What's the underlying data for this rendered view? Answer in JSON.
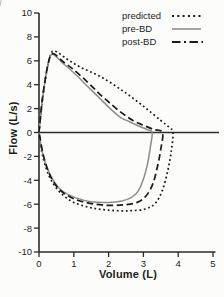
{
  "figure": {
    "background": "#fcfcfa",
    "axis_color": "#2b2b2b",
    "text_color": "#1c1c1c"
  },
  "chart_data": {
    "type": "line",
    "title": "",
    "xlabel": "Volume (L)",
    "ylabel": "Flow (L/s)",
    "xlim": [
      0,
      5
    ],
    "ylim": [
      -10,
      10
    ],
    "x_ticks": [
      0,
      1,
      2,
      3,
      4,
      5
    ],
    "x_tick_labels": [
      "0",
      "1",
      "2",
      "3",
      "4",
      "5"
    ],
    "y_ticks": [
      10,
      8,
      6,
      4,
      2,
      0,
      -2,
      -4,
      -6,
      -8,
      -10
    ],
    "y_tick_labels": [
      "10",
      "8",
      "6",
      "4",
      "2",
      "0",
      "-2",
      "-4",
      "-6",
      "-8",
      "-10"
    ],
    "grid": false,
    "legend_position": "top-right",
    "series": [
      {
        "name": "predicted",
        "style": "dotted",
        "color": "#1a1a1a",
        "description": "predicted flow-volume loop; PEF 6.8 L/s at 0.45 L, FVC 3.85 L, peak inspiratory flow -6.55 L/s",
        "points": [
          [
            0,
            0
          ],
          [
            0.12,
            3.2
          ],
          [
            0.3,
            6.2
          ],
          [
            0.45,
            6.8
          ],
          [
            0.8,
            6.15
          ],
          [
            1.2,
            5.45
          ],
          [
            1.75,
            4.7
          ],
          [
            2.4,
            3.5
          ],
          [
            3.0,
            2.2
          ],
          [
            3.5,
            1.0
          ],
          [
            3.75,
            0.4
          ],
          [
            3.85,
            0
          ],
          [
            3.8,
            -1.6
          ],
          [
            3.7,
            -3.2
          ],
          [
            3.55,
            -4.8
          ],
          [
            3.35,
            -5.9
          ],
          [
            3.05,
            -6.4
          ],
          [
            2.55,
            -6.55
          ],
          [
            2.0,
            -6.5
          ],
          [
            1.5,
            -6.3
          ],
          [
            1.0,
            -5.85
          ],
          [
            0.6,
            -5.0
          ],
          [
            0.3,
            -3.7
          ],
          [
            0.1,
            -1.9
          ],
          [
            0,
            0
          ]
        ]
      },
      {
        "name": "pre-BD",
        "style": "solid",
        "color": "#8d8d8d",
        "description": "pre-bronchodilator loop; PEF 6.55 L/s at 0.38 L, concave expiratory limb, FVC 3.25 L, peak inspiratory flow -5.85 L/s",
        "points": [
          [
            0,
            0
          ],
          [
            0.1,
            2.8
          ],
          [
            0.25,
            5.6
          ],
          [
            0.38,
            6.55
          ],
          [
            0.7,
            5.75
          ],
          [
            1.0,
            5.0
          ],
          [
            1.4,
            3.85
          ],
          [
            1.75,
            2.85
          ],
          [
            2.1,
            1.85
          ],
          [
            2.35,
            1.25
          ],
          [
            2.6,
            0.9
          ],
          [
            2.9,
            0.5
          ],
          [
            3.1,
            0.25
          ],
          [
            3.25,
            0
          ],
          [
            3.2,
            -1.2
          ],
          [
            3.12,
            -2.6
          ],
          [
            3.0,
            -3.9
          ],
          [
            2.85,
            -4.9
          ],
          [
            2.65,
            -5.45
          ],
          [
            2.35,
            -5.75
          ],
          [
            2.0,
            -5.85
          ],
          [
            1.5,
            -5.8
          ],
          [
            1.05,
            -5.45
          ],
          [
            0.65,
            -4.85
          ],
          [
            0.4,
            -3.95
          ],
          [
            0.2,
            -2.7
          ],
          [
            0.07,
            -1.3
          ],
          [
            0,
            0
          ]
        ]
      },
      {
        "name": "post-BD",
        "style": "dashed",
        "color": "#1a1a1a",
        "description": "post-bronchodilator loop; PEF 6.6 L/s at 0.4 L, FVC 3.55 L, peak inspiratory flow -6.1 L/s",
        "points": [
          [
            0,
            0
          ],
          [
            0.1,
            2.9
          ],
          [
            0.26,
            5.7
          ],
          [
            0.4,
            6.6
          ],
          [
            0.7,
            5.9
          ],
          [
            1.0,
            5.25
          ],
          [
            1.4,
            4.2
          ],
          [
            1.75,
            3.2
          ],
          [
            2.1,
            2.3
          ],
          [
            2.4,
            1.6
          ],
          [
            2.7,
            1.0
          ],
          [
            3.0,
            0.6
          ],
          [
            3.3,
            0.25
          ],
          [
            3.55,
            0
          ],
          [
            3.5,
            -1.4
          ],
          [
            3.4,
            -2.9
          ],
          [
            3.27,
            -4.3
          ],
          [
            3.08,
            -5.3
          ],
          [
            2.82,
            -5.85
          ],
          [
            2.45,
            -6.05
          ],
          [
            2.0,
            -6.1
          ],
          [
            1.5,
            -5.95
          ],
          [
            1.0,
            -5.55
          ],
          [
            0.62,
            -4.85
          ],
          [
            0.35,
            -3.8
          ],
          [
            0.15,
            -2.2
          ],
          [
            0,
            0
          ]
        ]
      }
    ]
  },
  "geometry": {
    "x0_px": 39,
    "px_per_L": 34.8,
    "y0_px": 132.5,
    "px_per_flow": 11.95,
    "zero_line_right_px": 219,
    "bottom_axis_right_px": 215.5,
    "tick_len": 5
  }
}
